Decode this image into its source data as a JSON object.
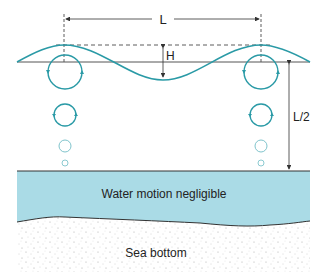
{
  "figure": {
    "labels": {
      "wavelength": "L",
      "wave_height": "H",
      "wave_base_depth": "L/2",
      "negligible_zone": "Water motion negligible",
      "sea_bottom": "Sea bottom"
    },
    "colors": {
      "wave": "#2a9aa6",
      "orbit": "#2a9aa6",
      "water_zone": "#aadbe6",
      "lines": "#333333",
      "sediment_dots": "#9a9a9a"
    },
    "orbits": [
      {
        "depth_level": 1,
        "radius": 17
      },
      {
        "depth_level": 2,
        "radius": 11
      },
      {
        "depth_level": 3,
        "radius": 6
      },
      {
        "depth_level": 4,
        "radius": 3
      }
    ]
  }
}
